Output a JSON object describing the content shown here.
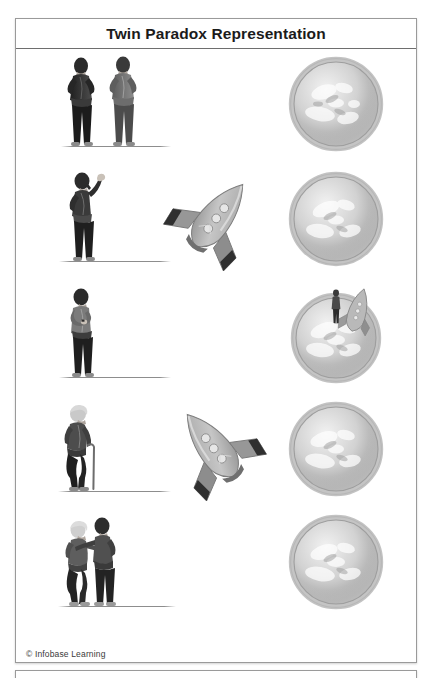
{
  "document": {
    "title": "Twin Paradox Representation",
    "copyright": "© Infobase Learning"
  },
  "panel": {
    "title": "Twin Paradox Representation",
    "border_color": "#9a9a9a",
    "title_rule_color": "#6e6e6e",
    "background": "#ffffff"
  },
  "colors": {
    "ink": "#1b1b1b",
    "figure_dark": "#2d2d2d",
    "figure_mid": "#6f6f6f",
    "figure_light": "#b9b9b9",
    "planet_light": "#dcdcdc",
    "planet_mid": "#bdbdbd",
    "planet_dark": "#9a9a9a",
    "ship_body": "#b4b4b4",
    "ship_wing": "#8f8f8f",
    "ship_exhaust": "#2f2f2f",
    "ground_line": "#8d8d8d"
  },
  "rows": [
    {
      "index": 1,
      "scene": "twins-together-on-earth",
      "people": "two-young-twins-standing-side-by-side",
      "spacecraft": "none",
      "planet": "earth-sphere"
    },
    {
      "index": 2,
      "scene": "one-twin-waves-goodbye-as-rocket-departs",
      "people": "young-twin-waving-goodbye",
      "spacecraft": "rocket-departing-pointing-up-right",
      "planet": "earth-sphere"
    },
    {
      "index": 3,
      "scene": "twin-on-earth-checks-watch-while-traveler-lands-on-distant-planet",
      "people": "young-twin-checking-wristwatch",
      "spacecraft": "none",
      "planet": "planet-with-landed-rocket-and-astronaut"
    },
    {
      "index": 4,
      "scene": "earthbound-twin-has-aged-while-rocket-returns",
      "people": "elderly-twin-with-walking-cane",
      "spacecraft": "rocket-returning-pointing-up-left",
      "planet": "earth-sphere"
    },
    {
      "index": 5,
      "scene": "twins-reunited-one-old-one-still-young",
      "people": "elderly-twin-embracing-young-twin",
      "spacecraft": "none",
      "planet": "earth-sphere"
    }
  ],
  "ship": {
    "window_count": 3,
    "label": "rocket-spacecraft"
  }
}
